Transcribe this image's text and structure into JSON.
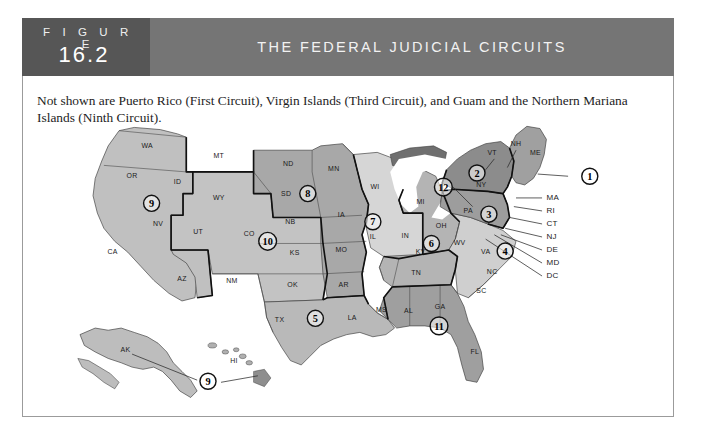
{
  "figure": {
    "label_word": "F I G U R E",
    "number": "16.2",
    "title": "THE FEDERAL JUDICIAL CIRCUITS",
    "note": "Not shown are Puerto Rico (First Circuit), Virgin Islands (Third Circuit), and Guam and the Northern Mariana Islands (Ninth Circuit)."
  },
  "colors": {
    "header_left": "#565656",
    "header_bar": "#757575",
    "header_text": "#f2f2f2",
    "border": "#9b9b9b",
    "shade_light": "#d2d2d2",
    "shade_mid": "#b6b6b6",
    "shade_dark": "#9a9a9a",
    "shade_darkest": "#6f6f6f",
    "circuit_outline": "#111111"
  },
  "map": {
    "state_labels": [
      {
        "code": "WA",
        "x": 64,
        "y": 24
      },
      {
        "code": "OR",
        "x": 50,
        "y": 52
      },
      {
        "code": "ID",
        "x": 92,
        "y": 57
      },
      {
        "code": "MT",
        "x": 130,
        "y": 33
      },
      {
        "code": "ND",
        "x": 194,
        "y": 41
      },
      {
        "code": "MN",
        "x": 236,
        "y": 45
      },
      {
        "code": "SD",
        "x": 192,
        "y": 68
      },
      {
        "code": "WY",
        "x": 130,
        "y": 72
      },
      {
        "code": "NV",
        "x": 74,
        "y": 96
      },
      {
        "code": "UT",
        "x": 111,
        "y": 103
      },
      {
        "code": "CO",
        "x": 158,
        "y": 105
      },
      {
        "code": "NB",
        "x": 196,
        "y": 94
      },
      {
        "code": "IA",
        "x": 243,
        "y": 88
      },
      {
        "code": "WI",
        "x": 274,
        "y": 62
      },
      {
        "code": "MI",
        "x": 316,
        "y": 76
      },
      {
        "code": "CA",
        "x": 32,
        "y": 122
      },
      {
        "code": "AZ",
        "x": 96,
        "y": 147
      },
      {
        "code": "NM",
        "x": 142,
        "y": 148
      },
      {
        "code": "KS",
        "x": 200,
        "y": 123
      },
      {
        "code": "MO",
        "x": 243,
        "y": 120
      },
      {
        "code": "IL",
        "x": 272,
        "y": 108
      },
      {
        "code": "IN",
        "x": 302,
        "y": 107
      },
      {
        "code": "OH",
        "x": 335,
        "y": 98
      },
      {
        "code": "OK",
        "x": 198,
        "y": 152
      },
      {
        "code": "AR",
        "x": 245,
        "y": 152
      },
      {
        "code": "KY",
        "x": 316,
        "y": 122
      },
      {
        "code": "TN",
        "x": 312,
        "y": 141
      },
      {
        "code": "WV",
        "x": 352,
        "y": 113
      },
      {
        "code": "VA",
        "x": 376,
        "y": 122
      },
      {
        "code": "NC",
        "x": 382,
        "y": 140
      },
      {
        "code": "SC",
        "x": 372,
        "y": 158
      },
      {
        "code": "TX",
        "x": 186,
        "y": 184
      },
      {
        "code": "LA",
        "x": 253,
        "y": 183
      },
      {
        "code": "MS",
        "x": 280,
        "y": 175
      },
      {
        "code": "AL",
        "x": 305,
        "y": 176
      },
      {
        "code": "GA",
        "x": 334,
        "y": 172
      },
      {
        "code": "FL",
        "x": 366,
        "y": 214
      },
      {
        "code": "PA",
        "x": 360,
        "y": 84
      },
      {
        "code": "NY",
        "x": 372,
        "y": 60
      },
      {
        "code": "VT",
        "x": 382,
        "y": 30
      },
      {
        "code": "NH",
        "x": 404,
        "y": 22
      },
      {
        "code": "ME",
        "x": 422,
        "y": 30
      },
      {
        "code": "AK",
        "x": 44,
        "y": 212
      },
      {
        "code": "HI",
        "x": 144,
        "y": 222
      }
    ],
    "side_labels": [
      "MA",
      "RI",
      "CT",
      "NJ",
      "DE",
      "MD",
      "DC"
    ],
    "circuit_markers": [
      {
        "n": "1",
        "x": 472,
        "y": 50
      },
      {
        "n": "2",
        "x": 368,
        "y": 47
      },
      {
        "n": "3",
        "x": 379,
        "y": 85
      },
      {
        "n": "4",
        "x": 394,
        "y": 119
      },
      {
        "n": "5",
        "x": 219,
        "y": 181
      },
      {
        "n": "6",
        "x": 326,
        "y": 112
      },
      {
        "n": "7",
        "x": 272,
        "y": 92
      },
      {
        "n": "8",
        "x": 212,
        "y": 66
      },
      {
        "n": "9",
        "x": 68,
        "y": 75
      },
      {
        "n": "9",
        "x": 120,
        "y": 239
      },
      {
        "n": "10",
        "x": 175,
        "y": 110
      },
      {
        "n": "11",
        "x": 333,
        "y": 188
      },
      {
        "n": "12",
        "x": 337,
        "y": 60
      }
    ]
  }
}
